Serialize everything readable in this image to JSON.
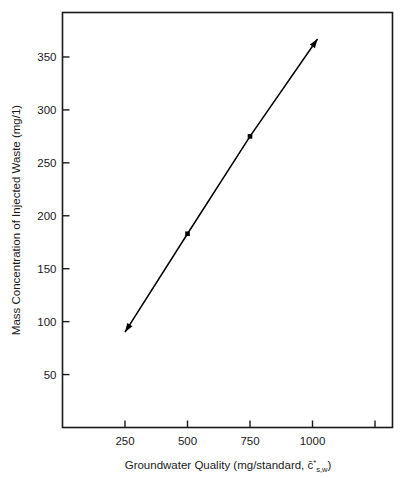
{
  "chart_data": {
    "type": "line",
    "title": "",
    "subtitle": "",
    "xlabel": "Groundwater Quality (mg/standard, c̄*s,w)",
    "xlabel_parts": {
      "main": "Groundwater Quality (mg/standard, ",
      "symbol": "c̄",
      "superscript": "*",
      "subscript": "s,w",
      "close": ")"
    },
    "ylabel": "Mass Concentration of Injected Waste (mg/1)",
    "xlim": [
      0,
      1320
    ],
    "ylim": [
      0,
      392
    ],
    "grid": false,
    "legend": null,
    "xticks": [
      250,
      500,
      750,
      1000,
      1250
    ],
    "xtick_labels": [
      "250",
      "500",
      "750",
      "1000",
      ""
    ],
    "yticks": [
      50,
      100,
      150,
      200,
      250,
      300,
      350
    ],
    "ytick_labels": [
      "50",
      "100",
      "150",
      "200",
      "250",
      "300",
      "350"
    ],
    "series": [
      {
        "name": "Injected waste vs groundwater quality",
        "marker": "square",
        "marker_color": "#000000",
        "line_color": "#000000",
        "arrow_start": true,
        "arrow_end": true,
        "x": [
          250,
          500,
          750,
          1020
        ],
        "y": [
          90,
          183,
          275,
          367
        ]
      }
    ],
    "annotations": []
  },
  "axes": {
    "frame_color": "#1a1a1a",
    "background": "#ffffff"
  }
}
